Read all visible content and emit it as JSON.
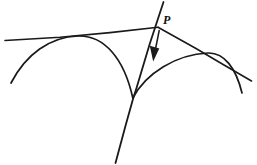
{
  "figure": {
    "kind": "geometry-line-drawing",
    "background_color": "#ffffff",
    "ink_color": "#1a1a1a",
    "width": 257,
    "height": 165,
    "labels": {
      "point_p": "P"
    },
    "caption_fragment": "",
    "elements": {
      "upper_tangent_line": {
        "name": "upper-left-tangent-line",
        "from": [
          5,
          40
        ],
        "to": [
          158,
          27
        ]
      },
      "right_tangent_line": {
        "name": "lower-right-tangent-line",
        "from": [
          158,
          27
        ],
        "to": [
          251,
          80
        ]
      },
      "normal_line": {
        "name": "normal-line-through-p",
        "from": [
          163,
          2
        ],
        "to": [
          115,
          163
        ]
      },
      "left_arc": {
        "name": "left-arc",
        "start": [
          11,
          83
        ],
        "control_one": [
          46,
          35
        ],
        "control_two": [
          101,
          33
        ],
        "end": [
          133,
          98
        ]
      },
      "right_arc": {
        "name": "right-arc",
        "start": [
          133,
          98
        ],
        "control_one": [
          161,
          66
        ],
        "control_two": [
          205,
          47
        ],
        "end": [
          242,
          93
        ]
      },
      "arrow": {
        "name": "direction-arrow",
        "shaft_from": [
          159,
          31
        ],
        "shaft_to": [
          155,
          51
        ],
        "head_tip": [
          153,
          61
        ],
        "head_left": [
          150,
          47
        ],
        "head_right": [
          159,
          49
        ]
      },
      "cusp_point": [
        133,
        98
      ],
      "apex_point": [
        158,
        27
      ],
      "left_tangency_point": [
        78,
        36
      ],
      "right_tangency_point": [
        208,
        53
      ]
    }
  }
}
